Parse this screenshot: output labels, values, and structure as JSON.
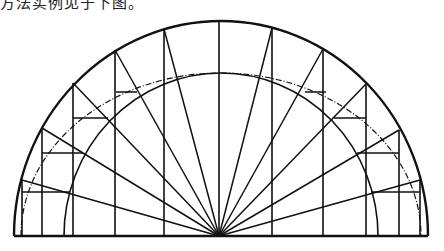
{
  "caption": "方法实例见于下图。",
  "diagram": {
    "center": [
      221,
      236
    ],
    "outer_arc": {
      "rx": 207,
      "ry": 215
    },
    "dashed_arc": {
      "rx": 200,
      "ry": 163
    },
    "inner_arc": {
      "rx": 157,
      "ry": 163
    },
    "verticals": [
      {
        "x": 22,
        "top": 180
      },
      {
        "x": 42,
        "top": 128
      },
      {
        "x": 73,
        "top": 83
      },
      {
        "x": 115,
        "top": 50
      },
      {
        "x": 164,
        "top": 29
      },
      {
        "x": 219,
        "top": 21
      },
      {
        "x": 272,
        "top": 28
      },
      {
        "x": 323,
        "top": 49
      },
      {
        "x": 366,
        "top": 84
      },
      {
        "x": 399,
        "top": 130
      },
      {
        "x": 420,
        "top": 180
      }
    ],
    "radial_ends": [
      [
        22,
        180
      ],
      [
        42,
        128
      ],
      [
        73,
        83
      ],
      [
        115,
        50
      ],
      [
        164,
        29
      ],
      [
        272,
        28
      ],
      [
        323,
        49
      ],
      [
        366,
        84
      ],
      [
        399,
        130
      ],
      [
        420,
        180
      ]
    ],
    "horizontals": [
      [
        22,
        192,
        70
      ],
      [
        42,
        153,
        83
      ],
      [
        73,
        118,
        108
      ],
      [
        116,
        92,
        137
      ],
      [
        305,
        92,
        326
      ],
      [
        334,
        118,
        366
      ],
      [
        357,
        153,
        399
      ],
      [
        371,
        192,
        420
      ]
    ]
  }
}
